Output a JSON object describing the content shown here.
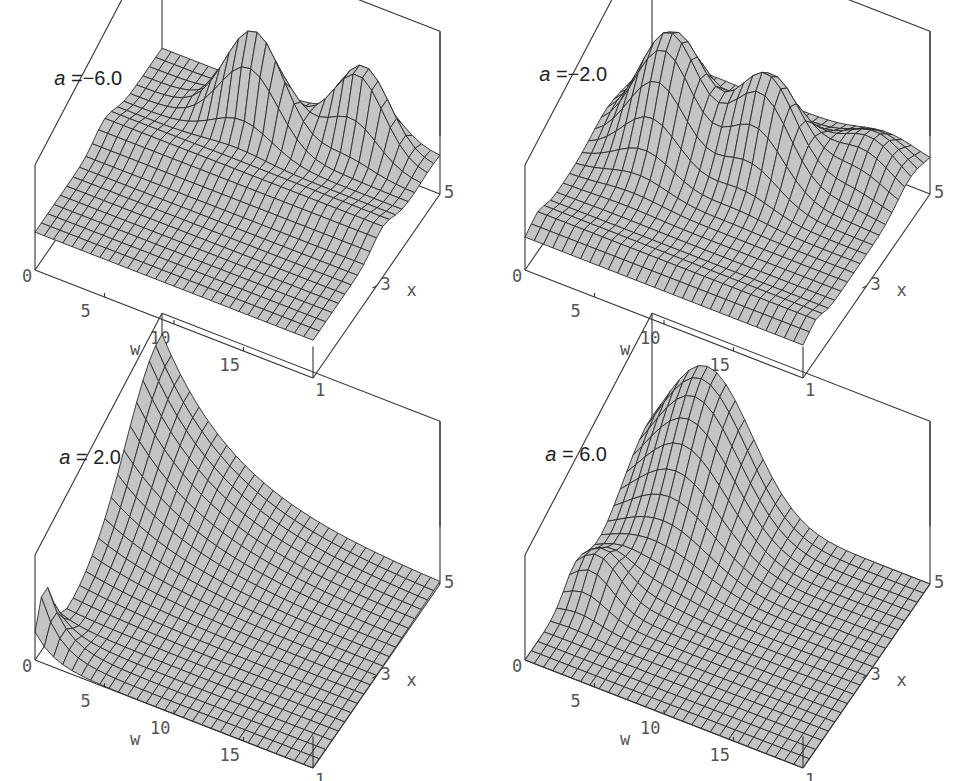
{
  "figure": {
    "panels": [
      {
        "id": "p1",
        "label_symbol": "a",
        "label_rest": " =−6.0",
        "a": -6.0,
        "offset": [
          0,
          0
        ],
        "surface": {
          "base": 0.36,
          "peaks": [
            {
              "x0": 3.2,
              "wc": 0.0,
              "ws": 0.0,
              "amp": 0.12,
              "sx": 0.45,
              "ridge": true
            },
            {
              "x0": 4.2,
              "wc": 8.5,
              "ws": 3.0,
              "amp": 0.95,
              "sx": 0.35,
              "ridge": false
            },
            {
              "x0": 4.7,
              "wc": 15.0,
              "ws": 2.6,
              "amp": 0.75,
              "sx": 0.35,
              "ridge": false
            }
          ]
        }
      },
      {
        "id": "p2",
        "label_symbol": "a",
        "label_rest": " =−2.0",
        "a": -2.0,
        "offset": [
          490,
          0
        ],
        "surface": {
          "base": 0.3,
          "peaks": [
            {
              "x0": 3.6,
              "wc": 4.5,
              "ws": 3.0,
              "amp": 1.05,
              "sx": 0.7,
              "ridge": false
            },
            {
              "x0": 3.8,
              "wc": 11.0,
              "ws": 3.0,
              "amp": 0.9,
              "sx": 0.6,
              "ridge": false
            },
            {
              "x0": 4.4,
              "wc": 17.0,
              "ws": 3.0,
              "amp": 0.35,
              "sx": 0.6,
              "ridge": false
            },
            {
              "x0": 1.4,
              "wc": 0.0,
              "ws": 0.0,
              "amp": 0.08,
              "sx": 0.3,
              "ridge": true
            }
          ]
        }
      },
      {
        "id": "p3",
        "label_symbol": "a",
        "label_rest": " = 2.0",
        "a": 2.0,
        "offset": [
          0,
          390
        ],
        "surface": {
          "base": 0.0,
          "peaks": [
            {
              "x0": 5.0,
              "wc": 0.0,
              "ws": 5.0,
              "amp": 1.35,
              "sx": 1.6,
              "ridge": false
            },
            {
              "x0": 1.3,
              "wc": 0.0,
              "ws": 1.3,
              "amp": 0.55,
              "sx": 0.35,
              "ridge": false
            }
          ]
        }
      },
      {
        "id": "p4",
        "label_symbol": "a",
        "label_rest": " = 6.0",
        "a": 6.0,
        "offset": [
          490,
          390
        ],
        "surface": {
          "base": 0.0,
          "peaks": [
            {
              "x0": 5.0,
              "wc": 4.0,
              "ws": 4.5,
              "amp": 1.25,
              "sx": 1.3,
              "ridge": false
            },
            {
              "x0": 2.6,
              "wc": 1.5,
              "ws": 2.2,
              "amp": 0.35,
              "sx": 0.5,
              "ridge": false
            }
          ]
        }
      }
    ],
    "w_axis": {
      "label": "w",
      "ticks": [
        "0",
        "5",
        "10",
        "15"
      ],
      "range": [
        0,
        20
      ]
    },
    "x_axis": {
      "label": "x",
      "ticks": [
        "1",
        "3",
        "5"
      ],
      "range": [
        1,
        5
      ]
    }
  },
  "chart_data": [
    {
      "type": "surface3d",
      "title": "a = -6.0",
      "xlabel": "w",
      "ylabel": "x",
      "x_range": [
        0,
        20
      ],
      "y_range": [
        1,
        5
      ],
      "x_ticks": [
        0,
        5,
        10,
        15
      ],
      "y_ticks": [
        1,
        3,
        5
      ],
      "description": "Mostly flat surface with two sharp peaks near x=5 at w≈8 and w≈15, plus a shallow ridge near x≈3"
    },
    {
      "type": "surface3d",
      "title": "a = -2.0",
      "xlabel": "w",
      "ylabel": "x",
      "x_range": [
        0,
        20
      ],
      "y_range": [
        1,
        5
      ],
      "x_ticks": [
        0,
        5,
        10,
        15
      ],
      "y_ticks": [
        1,
        3,
        5
      ],
      "description": "Two tall ridges near x≈4 at w≈4 and w≈11, a smaller bump at w≈17, flat elsewhere"
    },
    {
      "type": "surface3d",
      "title": "a = 2.0",
      "xlabel": "w",
      "ylabel": "x",
      "x_range": [
        0,
        20
      ],
      "y_range": [
        1,
        5
      ],
      "x_ticks": [
        0,
        5,
        10,
        15
      ],
      "y_ticks": [
        1,
        3,
        5
      ],
      "description": "Surface rises steeply toward low w and high x (max at w≈0, x=5), decays to zero for larger w"
    },
    {
      "type": "surface3d",
      "title": "a = 6.0",
      "xlabel": "w",
      "ylabel": "x",
      "x_range": [
        0,
        20
      ],
      "y_range": [
        1,
        5
      ],
      "x_ticks": [
        0,
        5,
        10,
        15
      ],
      "y_ticks": [
        1,
        3,
        5
      ],
      "description": "Single peak near x=5, w≈4, decaying toward larger w and smaller x"
    }
  ]
}
